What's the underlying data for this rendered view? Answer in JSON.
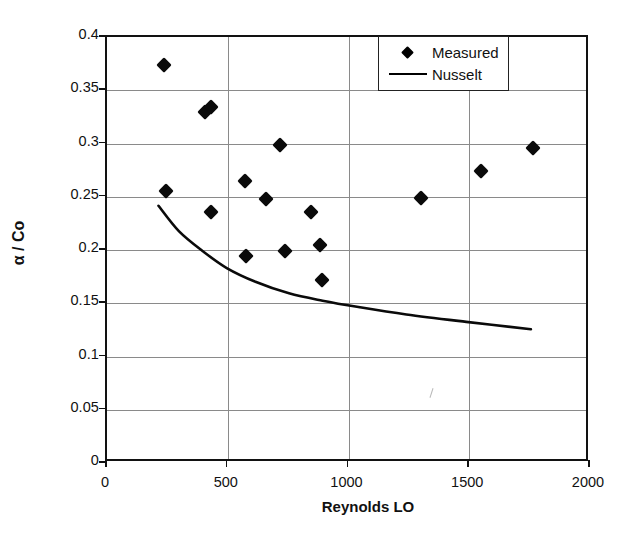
{
  "chart_data": {
    "type": "scatter",
    "title": "",
    "xlabel": "Reynolds LO",
    "ylabel": "α / Co",
    "xlim": [
      0,
      2000
    ],
    "ylim": [
      0,
      0.4
    ],
    "xticks": [
      "0",
      "500",
      "1000",
      "1500",
      "2000"
    ],
    "xtick_values": [
      0,
      500,
      1000,
      1500,
      2000
    ],
    "yticks": [
      "0",
      "0.05",
      "0.1",
      "0.15",
      "0.2",
      "0.25",
      "0.3",
      "0.35",
      "0.4"
    ],
    "ytick_values": [
      0,
      0.05,
      0.1,
      0.15,
      0.2,
      0.25,
      0.3,
      0.35,
      0.4
    ],
    "grid": true,
    "legend_position": "top-right",
    "series": [
      {
        "name": "Measured",
        "type": "scatter",
        "marker": "diamond",
        "color": "#000000",
        "points": [
          {
            "x": 236,
            "y": 0.374
          },
          {
            "x": 245,
            "y": 0.255
          },
          {
            "x": 406,
            "y": 0.33
          },
          {
            "x": 430,
            "y": 0.334
          },
          {
            "x": 432,
            "y": 0.236
          },
          {
            "x": 570,
            "y": 0.265
          },
          {
            "x": 575,
            "y": 0.194
          },
          {
            "x": 660,
            "y": 0.248
          },
          {
            "x": 715,
            "y": 0.299
          },
          {
            "x": 735,
            "y": 0.199
          },
          {
            "x": 845,
            "y": 0.236
          },
          {
            "x": 880,
            "y": 0.205
          },
          {
            "x": 890,
            "y": 0.172
          },
          {
            "x": 1300,
            "y": 0.249
          },
          {
            "x": 1550,
            "y": 0.274
          },
          {
            "x": 1765,
            "y": 0.296
          }
        ]
      },
      {
        "name": "Nusselt",
        "type": "line",
        "color": "#000000",
        "points": [
          {
            "x": 215,
            "y": 0.24
          },
          {
            "x": 300,
            "y": 0.216
          },
          {
            "x": 400,
            "y": 0.197
          },
          {
            "x": 500,
            "y": 0.181
          },
          {
            "x": 620,
            "y": 0.168
          },
          {
            "x": 760,
            "y": 0.157
          },
          {
            "x": 900,
            "y": 0.15
          },
          {
            "x": 1050,
            "y": 0.144
          },
          {
            "x": 1250,
            "y": 0.137
          },
          {
            "x": 1500,
            "y": 0.13
          },
          {
            "x": 1770,
            "y": 0.123
          }
        ]
      }
    ]
  },
  "legend": {
    "items": [
      {
        "label": "Measured",
        "key": "diamond-marker"
      },
      {
        "label": "Nusselt",
        "key": "line-marker"
      }
    ]
  }
}
